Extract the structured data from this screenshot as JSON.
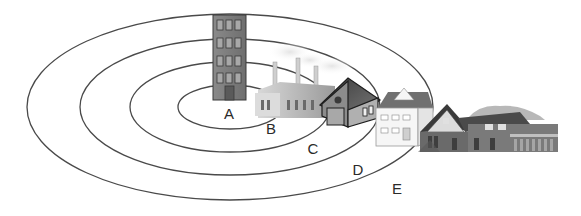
{
  "diagram": {
    "type": "concentric-zone-model",
    "background": "#ffffff",
    "ring_color": "#4a4a4a",
    "center": {
      "x": 230,
      "y": 107
    },
    "rings": [
      {
        "rx": 52,
        "ry": 22
      },
      {
        "rx": 100,
        "ry": 45
      },
      {
        "rx": 150,
        "ry": 68
      },
      {
        "rx": 203,
        "ry": 93
      }
    ],
    "zones": [
      {
        "label": "A",
        "x": 229,
        "y": 113,
        "depicts": "high-rise office building"
      },
      {
        "label": "B",
        "x": 271,
        "y": 128,
        "depicts": "factory with smokestacks"
      },
      {
        "label": "C",
        "x": 313,
        "y": 148,
        "depicts": "small house"
      },
      {
        "label": "D",
        "x": 358,
        "y": 169,
        "depicts": "detached white house"
      },
      {
        "label": "E",
        "x": 397,
        "y": 188,
        "depicts": "large suburban house"
      }
    ]
  }
}
